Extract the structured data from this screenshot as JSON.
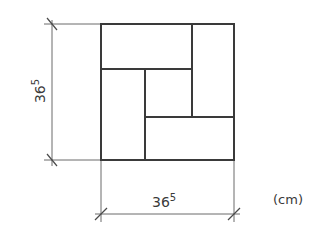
{
  "diagram": {
    "title": "",
    "units": "(cm)",
    "dimensions": {
      "vertical": {
        "base": "36",
        "superscript": "5"
      },
      "horizontal": {
        "base": "36",
        "superscript": "5"
      }
    },
    "colors": {
      "line": "#3a3a3a",
      "dim_line": "#6a6a6a",
      "background": "#ffffff"
    },
    "layout": {
      "outer_square": {
        "x": 101,
        "y": 24,
        "w": 133,
        "h": 136
      },
      "pieces": [
        {
          "name": "top-left-horizontal-brick",
          "x": 101,
          "y": 24,
          "w": 91,
          "h": 45
        },
        {
          "name": "top-right-vertical-brick",
          "x": 192,
          "y": 24,
          "w": 42,
          "h": 93
        },
        {
          "name": "left-vertical-brick",
          "x": 101,
          "y": 69,
          "w": 44,
          "h": 91
        },
        {
          "name": "center-square",
          "x": 145,
          "y": 69,
          "w": 47,
          "h": 48
        },
        {
          "name": "bottom-right-horizontal-brick",
          "x": 145,
          "y": 117,
          "w": 89,
          "h": 43
        }
      ]
    }
  }
}
